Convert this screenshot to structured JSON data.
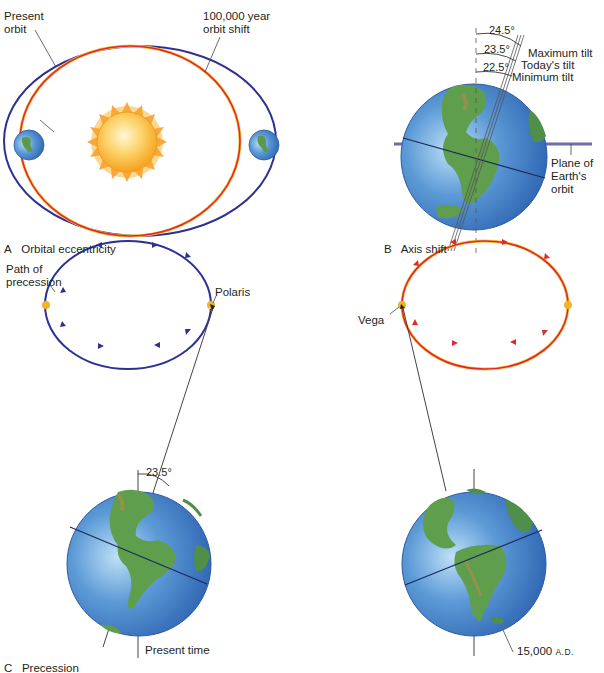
{
  "panels": {
    "a": {
      "caption_letter": "A",
      "caption": "Orbital eccentricity",
      "label_present_orbit_1": "Present",
      "label_present_orbit_2": "orbit",
      "label_shift_1": "100,000 year",
      "label_shift_2": "orbit shift"
    },
    "b": {
      "caption_letter": "B",
      "caption": "Axis shift",
      "angle_max": "24.5°",
      "angle_today": "23.5°",
      "angle_min": "22.5°",
      "label_max": "Maximum tilt",
      "label_today": "Today's tilt",
      "label_min": "Minimum tilt",
      "plane_1": "Plane of",
      "plane_2": "Earth's",
      "plane_3": "orbit"
    },
    "c": {
      "caption_letter": "C",
      "caption": "Precession",
      "path_1": "Path of",
      "path_2": "precession",
      "polaris": "Polaris",
      "angle": "23.5°",
      "present_time": "Present time",
      "vega": "Vega",
      "future_num": "15,000",
      "future_era": "A.D."
    }
  },
  "colors": {
    "present_orbit": "#2e3192",
    "shifted_orbit": "#e02a2a",
    "sun": "#f7a823",
    "ocean": "#3f7fc6",
    "land": "#5a9a4a",
    "star": "#f0b429"
  }
}
